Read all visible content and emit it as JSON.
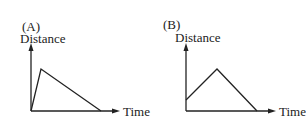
{
  "graphs": [
    {
      "label": "(A)",
      "y_axis_label": "Distance",
      "x_axis_label": "Time",
      "points": [
        [
          0,
          0
        ],
        [
          10,
          42
        ],
        [
          70,
          0
        ]
      ],
      "description": "Steep rise to peak, then long gradual decline to zero"
    },
    {
      "label": "(B)",
      "y_axis_label": "Distance",
      "x_axis_label": "Time",
      "points": [
        [
          0,
          11
        ],
        [
          31,
          42
        ],
        [
          71,
          0
        ]
      ],
      "description": "Starts above zero, rises linearly to peak, then declines linearly to zero"
    }
  ],
  "colors": {
    "line": "#222222",
    "background": "#ffffff"
  }
}
